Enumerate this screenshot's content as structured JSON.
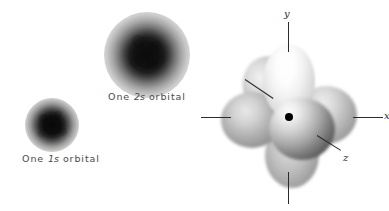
{
  "figure": {
    "background_color": "#ffffff",
    "width": 389,
    "height": 211
  },
  "s_orbitals": {
    "items": [
      {
        "id": "orbital-1s",
        "shell": "1",
        "subshell": "s",
        "caption_prefix": "One ",
        "caption_orbital": "1s",
        "caption_suffix": " orbital",
        "caption_full": "One 1s orbital",
        "center_x": 52,
        "center_y": 125,
        "diameter": 54,
        "core_color": "#0a0a0a",
        "halo_color": "#c8c8c8"
      },
      {
        "id": "orbital-2s",
        "shell": "2",
        "subshell": "s",
        "caption_prefix": "One ",
        "caption_orbital": "2s",
        "caption_suffix": " orbital",
        "caption_full": "One 2s orbital",
        "center_x": 147,
        "center_y": 55,
        "diameter": 86,
        "core_color": "#0c0c0c",
        "halo_color": "#c9c9c9"
      }
    ]
  },
  "p_orbital_set": {
    "description": "Set of three mutually perpendicular p orbitals, six lobes around a central nucleus",
    "nucleus_label": "nucleus",
    "lobe_count": 6,
    "axes": [
      {
        "id": "axis-y",
        "label": "y",
        "direction": "up",
        "labeled": true
      },
      {
        "id": "axis-x",
        "label": "x",
        "direction": "right",
        "labeled": true
      },
      {
        "id": "axis-z",
        "label": "z",
        "direction": "front",
        "labeled": true
      },
      {
        "id": "axis-left",
        "label": "",
        "direction": "left",
        "labeled": false
      },
      {
        "id": "axis-down",
        "label": "",
        "direction": "down",
        "labeled": false
      }
    ],
    "leaders": [
      {
        "id": "leader-node",
        "label": "",
        "target": "node-region"
      },
      {
        "id": "leader-z",
        "label": "z",
        "target": "front-lobe"
      }
    ],
    "lobes": [
      {
        "id": "lobe-top",
        "axis": "y+",
        "shade": "lightest",
        "color": "#f2f2f2"
      },
      {
        "id": "lobe-bottom",
        "axis": "y-",
        "shade": "mid",
        "color": "#bcbcbc"
      },
      {
        "id": "lobe-left",
        "axis": "x-",
        "shade": "mid",
        "color": "#b4b4b4"
      },
      {
        "id": "lobe-right",
        "axis": "x+",
        "shade": "mid",
        "color": "#bfbfbf"
      },
      {
        "id": "lobe-upper-left",
        "axis": "z-",
        "shade": "mid",
        "color": "#bdbdbd"
      },
      {
        "id": "lobe-front",
        "axis": "z+",
        "shade": "darkest",
        "color": "#5c5c5c"
      }
    ],
    "nucleus_color": "#000000"
  }
}
